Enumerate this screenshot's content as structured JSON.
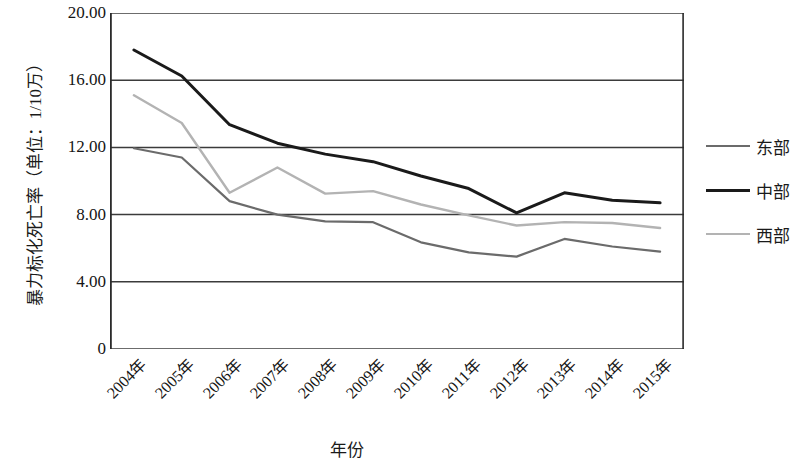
{
  "chart_data": {
    "type": "line",
    "title": "",
    "xlabel": "年份",
    "ylabel": "暴力标化死亡率（单位：1/10万）",
    "categories": [
      "2004年",
      "2005年",
      "2006年",
      "2007年",
      "2008年",
      "2009年",
      "2010年",
      "2011年",
      "2012年",
      "2013年",
      "2014年",
      "2015年"
    ],
    "x_tick_labels": [
      "2004年",
      "2005年",
      "2006年",
      "2007年",
      "2008年",
      "2009年",
      "2010年",
      "2011年",
      "2012年",
      "2013年",
      "2014年",
      "2015年"
    ],
    "y_tick_labels": [
      "20.00",
      "16.00",
      "12.00",
      "8.00",
      "4.00",
      "0"
    ],
    "y_tick_values": [
      20,
      16,
      12,
      8,
      4,
      0
    ],
    "ylim": [
      0,
      20
    ],
    "grid": "horizontal",
    "legend_position": "right",
    "series": [
      {
        "name": "东部",
        "color": "#6b6b6b",
        "width": 2.2,
        "values": [
          11.95,
          11.4,
          8.8,
          8.0,
          7.6,
          7.55,
          6.35,
          5.75,
          5.5,
          6.55,
          6.1,
          5.8
        ]
      },
      {
        "name": "中部",
        "color": "#1a1a1a",
        "width": 3.0,
        "values": [
          17.8,
          16.25,
          13.35,
          12.25,
          11.6,
          11.15,
          10.3,
          9.55,
          8.1,
          9.3,
          8.85,
          8.7
        ]
      },
      {
        "name": "西部",
        "color": "#b3b3b3",
        "width": 2.4,
        "values": [
          15.1,
          13.45,
          9.3,
          10.8,
          9.25,
          9.4,
          8.6,
          7.95,
          7.35,
          7.55,
          7.5,
          7.2
        ]
      }
    ]
  },
  "legend": {
    "items": [
      {
        "label": "东部",
        "color": "#6b6b6b",
        "width": 2.4
      },
      {
        "label": "中部",
        "color": "#1a1a1a",
        "width": 3.2
      },
      {
        "label": "西部",
        "color": "#b3b3b3",
        "width": 2.6
      }
    ]
  },
  "axes": {
    "y_title": "暴力标化死亡率（单位：1/10万）",
    "x_title": "年份"
  }
}
